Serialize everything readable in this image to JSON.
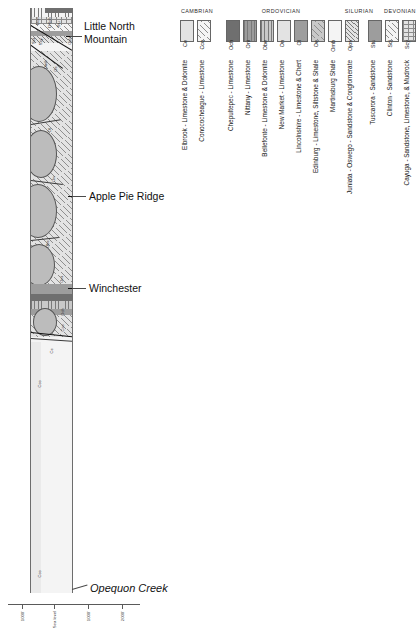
{
  "diagram": {
    "callouts": [
      {
        "name": "little-north-mountain",
        "label": "Little North\nMountain",
        "italic": false
      },
      {
        "name": "apple-pie-ridge",
        "label": "Apple Pie Ridge",
        "italic": false
      },
      {
        "name": "winchester",
        "label": "Winchester",
        "italic": false
      },
      {
        "name": "opequon-creek",
        "label": "Opequon Creek",
        "italic": true
      }
    ],
    "section_codes": [
      {
        "code": "Don",
        "x": 6,
        "y": 9
      },
      {
        "code": "DSoh",
        "x": 18,
        "y": 9
      },
      {
        "code": "Stu",
        "x": 27,
        "y": 13
      },
      {
        "code": "Sci",
        "x": 2,
        "y": 30
      },
      {
        "code": "Scy",
        "x": 9,
        "y": 30
      },
      {
        "code": "Ojos",
        "x": 38,
        "y": 28
      },
      {
        "code": "Omb",
        "x": 14,
        "y": 52
      },
      {
        "code": "Oe",
        "x": 24,
        "y": 58
      },
      {
        "code": "Ol",
        "x": 18,
        "y": 120
      },
      {
        "code": "On",
        "x": 22,
        "y": 168
      },
      {
        "code": "Obe",
        "x": 16,
        "y": 232
      },
      {
        "code": "Oni",
        "x": 30,
        "y": 268
      },
      {
        "code": "Och",
        "x": 31,
        "y": 300
      },
      {
        "code": "Cco",
        "x": 31,
        "y": 316
      },
      {
        "code": "Ce",
        "x": 20,
        "y": 340
      },
      {
        "code": "Cco",
        "x": 8,
        "y": 372
      },
      {
        "code": "Cco",
        "x": 8,
        "y": 562
      }
    ],
    "scale": {
      "labels": [
        "1000'",
        "Sea level",
        "1000'",
        "2000'"
      ]
    }
  },
  "legend": {
    "periods": [
      {
        "name": "CAMBRIAN",
        "left": 8,
        "width": 34
      },
      {
        "name": "ORDOVICIAN",
        "left": 54,
        "width": 110
      },
      {
        "name": "SILURIAN",
        "left": 168,
        "width": 38
      },
      {
        "name": "DEVONIAN",
        "left": 212,
        "width": 32
      }
    ],
    "units": [
      {
        "code": "Ce",
        "name": "Elbrook - Limestone & Dolomite",
        "fill": "g-vlt",
        "pattern": "",
        "x": 8
      },
      {
        "code": "Cco",
        "name": "Conococheague - Limestone",
        "fill": "g-wht",
        "pattern": "p-hatch",
        "x": 25
      },
      {
        "code": "Och",
        "name": "Chepultepec - Limestone",
        "fill": "g-dark",
        "pattern": "",
        "x": 54
      },
      {
        "code": "Oni",
        "name": "Nittany - Limestone",
        "fill": "g-mid",
        "pattern": "p-vert",
        "x": 71
      },
      {
        "code": "Obe",
        "name": "Bellefonte - Limestone & Dolomite",
        "fill": "g-lt",
        "pattern": "p-vert",
        "x": 88
      },
      {
        "code": "On",
        "name": "New Market - Limestone",
        "fill": "g-vlt",
        "pattern": "",
        "x": 105
      },
      {
        "code": "Ol",
        "name": "Lincolnshire - Limestone & Chert",
        "fill": "g-mid",
        "pattern": "",
        "x": 122
      },
      {
        "code": "Oe",
        "name": "Edinburg - Limestone, Siltstone & Shale",
        "fill": "g-lt",
        "pattern": "p-hatch",
        "x": 139
      },
      {
        "code": "Omb",
        "name": "Martinsburg Shale",
        "fill": "g-wht",
        "pattern": "",
        "x": 156
      },
      {
        "code": "Ojos",
        "name": "Juniata - Oswego - Sandstone & Conglomerate",
        "fill": "g-vlt",
        "pattern": "p-hatch-tight",
        "x": 173
      },
      {
        "code": "Stu",
        "name": "Tuscarora - Sandstone",
        "fill": "g-mid",
        "pattern": "",
        "x": 196
      },
      {
        "code": "Sci",
        "name": "Clinton - Sandstone",
        "fill": "g-wht",
        "pattern": "p-hatch",
        "x": 213
      },
      {
        "code": "Scy",
        "name": "Cayuga - Sandstone, Limestone, & Mudrock",
        "fill": "g-vlt",
        "pattern": "p-brick",
        "x": 230
      },
      {
        "code": "DSoh",
        "name": "Oriskany - Sandstone\nHelderberg - Limestones",
        "fill": "g-wht",
        "pattern": "p-vert",
        "x": 256
      },
      {
        "code": "Don",
        "name": "Onondaga - Shale",
        "fill": "g-dark",
        "pattern": "",
        "x": 273
      }
    ]
  }
}
